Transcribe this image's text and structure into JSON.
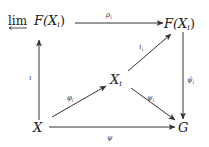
{
  "diagram": {
    "type": "commutative-diagram",
    "nodes": {
      "lim": {
        "prefix": "lim",
        "text": "F(X",
        "sub": "i",
        "close": ")"
      },
      "fxi": {
        "text": "F(X",
        "sub": "i",
        "close": ")"
      },
      "xi": {
        "text": "X",
        "sub": "i"
      },
      "x": {
        "text": "X"
      },
      "g": {
        "text": "G"
      }
    },
    "arrows": [
      {
        "from": "lim",
        "to": "fxi",
        "label": "ρ",
        "sub": "i"
      },
      {
        "from": "x",
        "to": "lim",
        "label": "ι",
        "sub": ""
      },
      {
        "from": "x",
        "to": "xi",
        "label": "φ",
        "sub": "i"
      },
      {
        "from": "xi",
        "to": "fxi",
        "label": "ι",
        "sub": "i"
      },
      {
        "from": "xi",
        "to": "g",
        "label": "ψ",
        "sub": "i"
      },
      {
        "from": "fxi",
        "to": "g",
        "label": "ψ̄",
        "sub": "i"
      },
      {
        "from": "x",
        "to": "g",
        "label": "ψ",
        "sub": ""
      }
    ]
  },
  "colors": {
    "ink": "#222222",
    "background": "#ffffff"
  }
}
